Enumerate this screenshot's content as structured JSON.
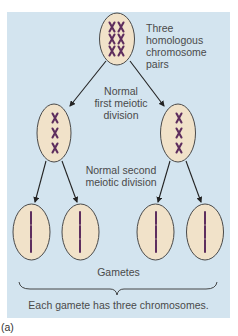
{
  "figure": {
    "label": "(a)",
    "colors": {
      "panel_bg": "#d3e4ef",
      "cell_fill": "#f1e2c9",
      "cell_stroke": "#4a4a4a",
      "chromosome": "#5e2e5e",
      "arrow": "#222222",
      "text": "#4a4a4a"
    }
  },
  "labels": {
    "top_cell": [
      "Three",
      "homologous",
      "chromosome",
      "pairs"
    ],
    "first_division": [
      "Normal",
      "first meiotic",
      "division"
    ],
    "second_division": [
      "Normal second",
      "meiotic division"
    ],
    "gametes": "Gametes",
    "summary": "Each gamete has three chromosomes."
  },
  "cells": [
    {
      "id": "parent",
      "chromosomes": "3 homologous pairs (XX ×3)"
    },
    {
      "id": "meiosis-I-left",
      "chromosomes": "3 duplicated (X ×3)"
    },
    {
      "id": "meiosis-I-right",
      "chromosomes": "3 duplicated (X ×3)"
    },
    {
      "id": "gamete-1",
      "chromosomes": 3
    },
    {
      "id": "gamete-2",
      "chromosomes": 3
    },
    {
      "id": "gamete-3",
      "chromosomes": 3
    },
    {
      "id": "gamete-4",
      "chromosomes": 3
    }
  ]
}
